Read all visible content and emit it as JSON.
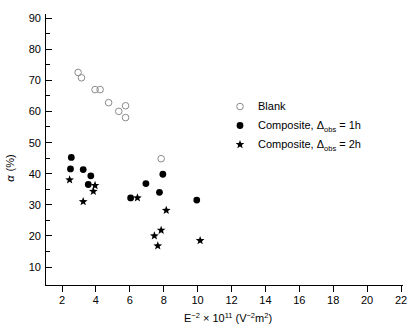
{
  "chart_data": {
    "type": "scatter",
    "title": "",
    "xlabel": "E-2 x 10^11 (V-2m2)",
    "xlabel_parts": {
      "base": "E",
      "base_sup": "−2",
      "times": " × 10",
      "exp": "11",
      "units_open": " (V",
      "units_sup1": "−2",
      "units_m": "m",
      "units_sup2": "2",
      "units_close": ")"
    },
    "ylabel": "α  (%)",
    "xlim": [
      1,
      22
    ],
    "ylim": [
      5,
      90
    ],
    "xticks": [
      2,
      4,
      6,
      8,
      10,
      12,
      14,
      16,
      18,
      20,
      22
    ],
    "yticks": [
      10,
      20,
      30,
      40,
      50,
      60,
      70,
      80,
      90
    ],
    "yticks_minor": [
      15,
      25,
      35,
      45,
      55,
      65,
      75,
      85
    ],
    "grid": false,
    "legend_position": "upper right",
    "series": [
      {
        "name": "Blank",
        "marker": "open-circle",
        "color": "#8a8a8a",
        "points": [
          {
            "x": 2.95,
            "y": 72.5
          },
          {
            "x": 3.15,
            "y": 70.8
          },
          {
            "x": 3.95,
            "y": 67.0
          },
          {
            "x": 4.25,
            "y": 67.0
          },
          {
            "x": 4.75,
            "y": 62.8
          },
          {
            "x": 5.35,
            "y": 60.0
          },
          {
            "x": 5.75,
            "y": 61.8
          },
          {
            "x": 5.75,
            "y": 58.0
          },
          {
            "x": 7.85,
            "y": 44.8
          }
        ]
      },
      {
        "name": "Composite, Δobs = 1h",
        "marker": "filled-circle",
        "color": "#000000",
        "points": [
          {
            "x": 2.55,
            "y": 45.2
          },
          {
            "x": 2.5,
            "y": 41.5
          },
          {
            "x": 3.25,
            "y": 41.3
          },
          {
            "x": 3.7,
            "y": 39.3
          },
          {
            "x": 3.55,
            "y": 36.5
          },
          {
            "x": 6.05,
            "y": 32.2
          },
          {
            "x": 6.95,
            "y": 36.8
          },
          {
            "x": 7.75,
            "y": 34.0
          },
          {
            "x": 7.95,
            "y": 39.8
          },
          {
            "x": 9.95,
            "y": 31.5
          }
        ]
      },
      {
        "name": "Composite, Δobs = 2h",
        "marker": "star",
        "color": "#000000",
        "points": [
          {
            "x": 2.45,
            "y": 38.0
          },
          {
            "x": 3.95,
            "y": 36.2
          },
          {
            "x": 3.85,
            "y": 34.3
          },
          {
            "x": 3.25,
            "y": 31.0
          },
          {
            "x": 6.45,
            "y": 32.2
          },
          {
            "x": 8.15,
            "y": 28.2
          },
          {
            "x": 7.85,
            "y": 21.8
          },
          {
            "x": 7.45,
            "y": 20.0
          },
          {
            "x": 7.65,
            "y": 16.8
          },
          {
            "x": 10.15,
            "y": 18.5
          }
        ]
      }
    ]
  },
  "legend": {
    "entries": [
      {
        "label": "Blank",
        "marker": "open-circle"
      },
      {
        "label": "Composite, ",
        "sym": "Δ",
        "sub": "obs",
        "tail": " = 1h",
        "marker": "filled-circle"
      },
      {
        "label": "Composite, ",
        "sym": "Δ",
        "sub": "obs",
        "tail": " = 2h",
        "marker": "star"
      }
    ]
  },
  "axes": {
    "x_tick_labels": [
      "2",
      "4",
      "6",
      "8",
      "10",
      "12",
      "14",
      "16",
      "18",
      "20",
      "22"
    ],
    "y_tick_labels": [
      "10",
      "20",
      "30",
      "40",
      "50",
      "60",
      "70",
      "80",
      "90"
    ],
    "y_axis_symbol": "α",
    "y_axis_unit": "(%)"
  }
}
